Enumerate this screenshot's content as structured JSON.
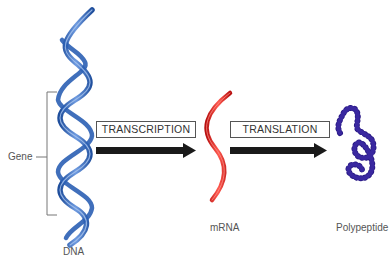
{
  "diagram": {
    "title": "",
    "colors": {
      "dna": "#2b5fb4",
      "dna_light": "#7aa3e0",
      "mrna": "#e0201c",
      "polypeptide": "#2a1a86",
      "arrow": "#1a1a1a",
      "label": "#555555"
    },
    "nodes": [
      {
        "id": "dna",
        "label": "DNA"
      },
      {
        "id": "mrna",
        "label": "mRNA"
      },
      {
        "id": "polypeptide",
        "label": "Polypeptide"
      }
    ],
    "gene_label": "Gene",
    "steps": [
      {
        "id": "transcription",
        "label": "TRANSCRIPTION",
        "from": "dna",
        "to": "mrna"
      },
      {
        "id": "translation",
        "label": "TRANSLATION",
        "from": "mrna",
        "to": "polypeptide"
      }
    ]
  }
}
